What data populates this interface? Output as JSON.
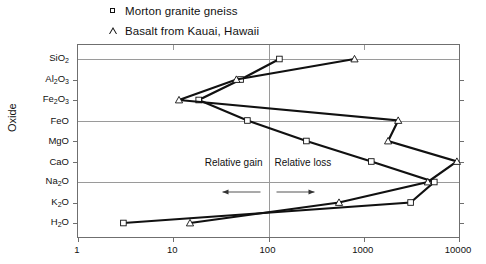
{
  "legend": {
    "items": [
      {
        "marker": "square-marker",
        "label": "Morton granite gneiss"
      },
      {
        "marker": "triangle-marker",
        "label": "Basalt from Kauai, Hawaii"
      }
    ]
  },
  "axes": {
    "ytitle": "Oxide",
    "xlabels": [
      "1",
      "10",
      "100",
      "1000",
      "10000"
    ]
  },
  "annotations": {
    "gain_text": "Relative gain",
    "loss_text": "Relative loss",
    "gain_arrow": "left-arrow",
    "loss_arrow": "right-arrow"
  },
  "chart_data": {
    "type": "scatter",
    "title": "",
    "xlabel": "",
    "ylabel": "Oxide",
    "xscale": "log",
    "xlim": [
      1,
      10000
    ],
    "xticks": [
      1,
      10,
      100,
      1000,
      10000
    ],
    "grid": "horizontal gridlines at SiO2, FeO, Na2O; vertical gridline at 100",
    "legend_position": "top",
    "categories": [
      "SiO2",
      "Al2O3",
      "Fe2O3",
      "FeO",
      "MgO",
      "CaO",
      "Na2O",
      "K2O",
      "H2O"
    ],
    "category_labels": [
      "SiO₂",
      "Al₂O₃",
      "Fe₂O₃",
      "FeO",
      "MgO",
      "CaO",
      "Na₂O",
      "K₂O",
      "H₂O"
    ],
    "series": [
      {
        "name": "Morton granite gneiss",
        "marker": "square",
        "values": [
          130,
          51,
          18.5,
          60,
          250,
          1200,
          5500,
          3100,
          3.0
        ]
      },
      {
        "name": "Basalt from Kauai, Hawaii",
        "marker": "triangle",
        "values": [
          800,
          46,
          11.5,
          2300,
          1800,
          9500,
          4700,
          550,
          15.0
        ]
      }
    ]
  }
}
